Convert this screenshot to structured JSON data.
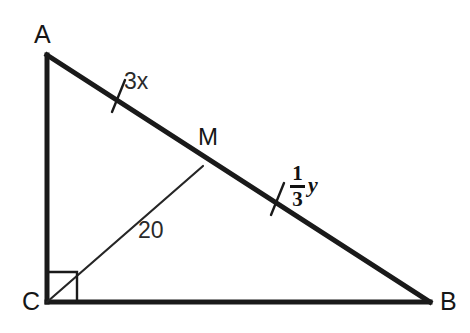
{
  "figure": {
    "background_color": "#ffffff",
    "stroke_color": "#1a1a1a",
    "thick_stroke_width": 5,
    "thin_stroke_width": 2,
    "vertices": [
      {
        "name": "A",
        "label": "A",
        "x": 47,
        "y": 55,
        "label_x": 34,
        "label_y": 22
      },
      {
        "name": "B",
        "label": "B",
        "x": 430,
        "y": 302,
        "label_x": 440,
        "label_y": 289
      },
      {
        "name": "C",
        "label": "C",
        "x": 47,
        "y": 302,
        "label_x": 22,
        "label_y": 289
      }
    ],
    "points": [
      {
        "name": "M",
        "label": "M",
        "x": 203,
        "y": 166,
        "label_x": 198,
        "label_y": 125
      }
    ],
    "sides": [
      {
        "name": "AC",
        "from": "A",
        "to": "C",
        "weight": "thick"
      },
      {
        "name": "CB",
        "from": "C",
        "to": "B",
        "weight": "thick"
      },
      {
        "name": "AB",
        "from": "A",
        "to": "B",
        "weight": "thick"
      }
    ],
    "median": {
      "name": "CM",
      "from": "C",
      "to": "M",
      "weight": "thin",
      "length_label": "20"
    },
    "right_angle": {
      "at": "C",
      "size": 30,
      "marker": "square"
    },
    "tick_marks": [
      {
        "name": "tick-AM",
        "on": "AB",
        "x": 118,
        "y": 96,
        "angle_deg": 68
      },
      {
        "name": "tick-MB",
        "on": "AB",
        "x": 277,
        "y": 199,
        "angle_deg": 68
      }
    ],
    "segment_labels": [
      {
        "name": "segment-am-label",
        "text": "3x",
        "x": 124,
        "y": 70,
        "style": "plain"
      },
      {
        "name": "median-length-label",
        "text": "20",
        "x": 138,
        "y": 219,
        "style": "plain"
      }
    ],
    "fraction_label": {
      "name": "segment-mb-label",
      "numerator": "1",
      "denominator": "3",
      "variable": "y",
      "x": 290,
      "y": 163
    }
  }
}
